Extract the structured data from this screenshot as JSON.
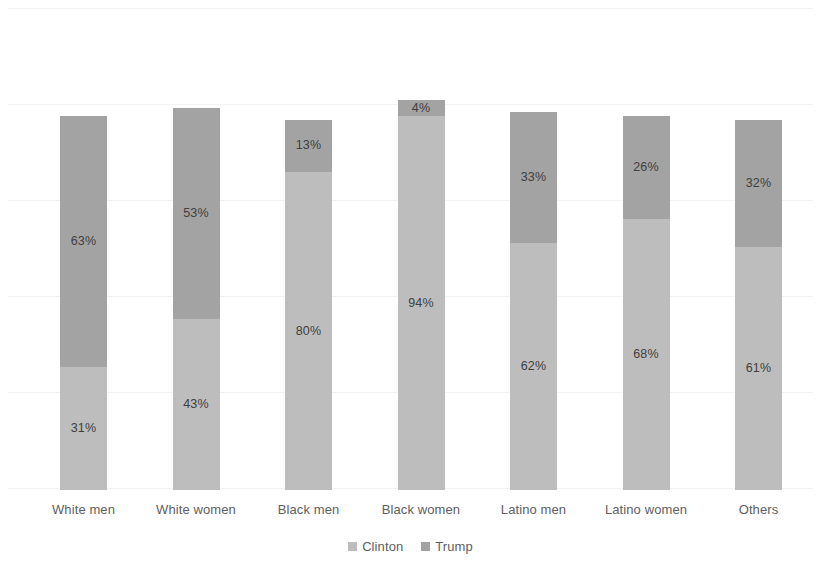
{
  "chart_data": {
    "type": "bar",
    "title": "",
    "subtitle": "",
    "xlabel": "",
    "ylabel": "",
    "ylim": [
      0,
      100
    ],
    "grid": true,
    "stacked": true,
    "legend_position": "bottom",
    "categories": [
      "White men",
      "White women",
      "Black men",
      "Black women",
      "Latino men",
      "Latino women",
      "Others"
    ],
    "series": [
      {
        "name": "Clinton",
        "color": "#bdbdbd",
        "values": [
          31,
          43,
          80,
          94,
          62,
          68,
          61
        ],
        "labels": [
          "31%",
          "43%",
          "80%",
          "94%",
          "62%",
          "68%",
          "61%"
        ]
      },
      {
        "name": "Trump",
        "color": "#a3a3a3",
        "values": [
          63,
          53,
          13,
          4,
          33,
          26,
          32
        ],
        "labels": [
          "63%",
          "53%",
          "13%",
          "4%",
          "33%",
          "26%",
          "32%"
        ]
      }
    ]
  },
  "legend": {
    "items": [
      {
        "label": "Clinton",
        "color": "#bdbdbd",
        "marker": "square-marker-icon"
      },
      {
        "label": "Trump",
        "color": "#a3a3a3",
        "marker": "square-marker-icon"
      }
    ]
  },
  "colors": {
    "background": "#ffffff",
    "gridline": "#f2f2f2",
    "clinton": "#bdbdbd",
    "trump": "#a3a3a3",
    "category_label": "#5e5e5e",
    "value_label": "#404040"
  },
  "axis": {
    "categories": [
      "White men",
      "White women",
      "Black men",
      "Black women",
      "Latino men",
      "Latino women",
      "Others"
    ]
  }
}
